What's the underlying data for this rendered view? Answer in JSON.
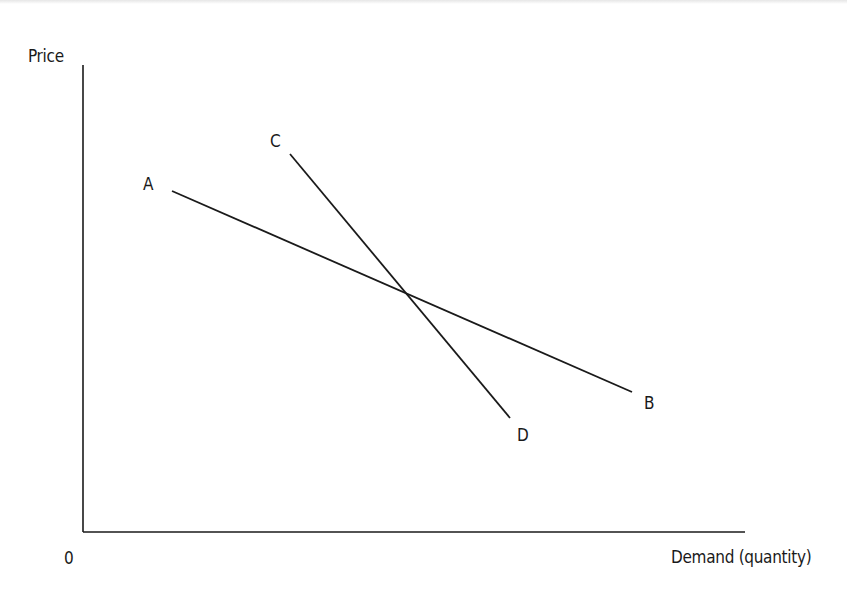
{
  "diagram": {
    "axes": {
      "y_label": "Price",
      "x_label": "Demand (quantity)",
      "origin_label": "0"
    },
    "lines": [
      {
        "name": "AB",
        "start_label": "A",
        "end_label": "B",
        "description": "Flatter (more elastic) demand curve"
      },
      {
        "name": "CD",
        "start_label": "C",
        "end_label": "D",
        "description": "Steeper (less elastic) demand curve"
      }
    ],
    "colors": {
      "line": "#1a1a1a",
      "axis": "#1a1a1a",
      "background": "#ffffff"
    }
  }
}
